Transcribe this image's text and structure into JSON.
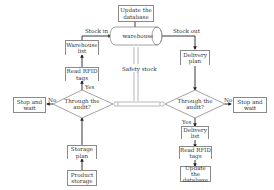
{
  "diagram": {
    "top": {
      "update_db": "Update the database",
      "warehouse": "warehouse",
      "stock_in": "Stock in",
      "stock_out": "Stock out"
    },
    "center": {
      "safety_stock": "Safety stock"
    },
    "left": {
      "warehouse_list": "Warehouse list",
      "read_rfid": "Read RFID tags",
      "yes": "Yes",
      "no": "No",
      "decision": "Through the audit?",
      "stop_wait": "Stop and wait",
      "storage_plan": "Storage plan",
      "product_storage": "Product storage"
    },
    "right": {
      "delivery_plan": "Delivery plan",
      "decision": "Through the audit?",
      "no": "No",
      "yes": "Yes",
      "stop_wait": "Stop and wait",
      "delivery_list": "Delivery list",
      "read_rfid": "Read RFID tags",
      "update_db": "Update the database"
    }
  }
}
